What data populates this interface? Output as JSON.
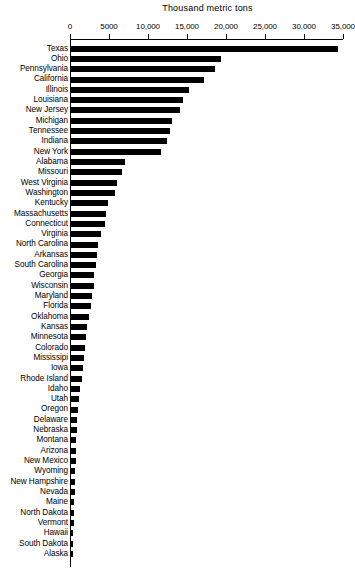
{
  "chart": {
    "title": "Thousand metric tons",
    "xlabel": "",
    "ylabel": ""
  },
  "axis": {
    "ticks": [
      {
        "label": "0",
        "value": 0
      },
      {
        "label": "5000",
        "value": 5000
      },
      {
        "label": "10,000",
        "value": 10000
      },
      {
        "label": "15,000",
        "value": 15000
      },
      {
        "label": "20,000",
        "value": 20000
      },
      {
        "label": "25,000",
        "value": 25000
      },
      {
        "label": "30,000",
        "value": 30000
      },
      {
        "label": "35,000",
        "value": 35000
      }
    ]
  },
  "colors": {
    "bar": "#000000",
    "axis": "#000000",
    "background": "#ffffff"
  },
  "chart_data": {
    "type": "bar",
    "orientation": "horizontal",
    "title": "Thousand metric tons",
    "xlabel": "Thousand metric tons",
    "ylabel": "",
    "xlim": [
      0,
      35000
    ],
    "grid": false,
    "legend": false,
    "axis_position": "top",
    "categories": [
      "Texas",
      "Ohio",
      "Pennsylvania",
      "California",
      "Illinois",
      "Louisiana",
      "New Jersey",
      "Michigan",
      "Tennessee",
      "Indiana",
      "New York",
      "Alabama",
      "Missouri",
      "West Virginia",
      "Washington",
      "Kentucky",
      "Massachusetts",
      "Connecticut",
      "Virginia",
      "North Carolina",
      "Arkansas",
      "South Carolina",
      "Georgia",
      "Wisconsin",
      "Maryland",
      "Florida",
      "Oklahoma",
      "Kansas",
      "Minnesota",
      "Colorado",
      "Mississipi",
      "Iowa",
      "Rhode Island",
      "Idaho",
      "Utah",
      "Oregon",
      "Delaware",
      "Nebraska",
      "Montana",
      "Arizona",
      "New Mexico",
      "Wyoming",
      "New Hampshire",
      "Nevada",
      "Maine",
      "North Dakota",
      "Vermont",
      "Hawaii",
      "South Dakota",
      "Alaska"
    ],
    "values": [
      34200,
      19200,
      18500,
      17000,
      15100,
      14400,
      14000,
      12900,
      12700,
      12300,
      11600,
      6900,
      6500,
      5900,
      5600,
      4700,
      4500,
      4300,
      3800,
      3500,
      3300,
      3200,
      3000,
      2900,
      2700,
      2500,
      2300,
      2100,
      1900,
      1800,
      1700,
      1500,
      1400,
      1150,
      1000,
      850,
      800,
      750,
      700,
      650,
      600,
      560,
      520,
      480,
      440,
      400,
      360,
      320,
      280,
      220
    ],
    "units": "thousand metric tons",
    "max_value": 34200,
    "min_value": 220
  }
}
